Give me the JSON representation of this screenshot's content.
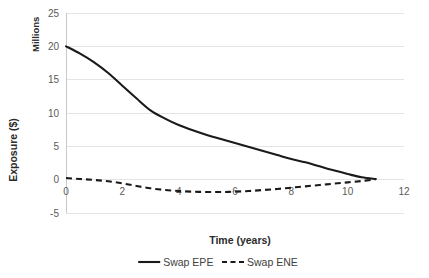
{
  "chart_data": {
    "type": "line",
    "title": "",
    "xlabel": "Time (years)",
    "ylabel": "Exposure ($)",
    "unit_label": "Millions",
    "xlim": [
      0,
      12
    ],
    "ylim": [
      -5,
      25
    ],
    "xticks": [
      "0",
      "2",
      "4",
      "6",
      "8",
      "10",
      "12"
    ],
    "yticks": [
      "25",
      "20",
      "15",
      "10",
      "5",
      "0",
      "-5"
    ],
    "grid": "horizontal",
    "legend_position": "bottom",
    "x": [
      0,
      0.5,
      1,
      1.5,
      2,
      2.5,
      3,
      3.5,
      4,
      4.5,
      5,
      5.5,
      6,
      6.5,
      7,
      7.5,
      8,
      8.5,
      9,
      9.5,
      10,
      10.5,
      11
    ],
    "series": [
      {
        "name": "Swap EPE",
        "style": "solid",
        "color": "#1a1a1a",
        "values": [
          20.0,
          18.9,
          17.6,
          16.0,
          14.1,
          12.2,
          10.4,
          9.2,
          8.2,
          7.4,
          6.7,
          6.1,
          5.5,
          4.9,
          4.3,
          3.7,
          3.1,
          2.6,
          2.0,
          1.4,
          0.85,
          0.35,
          0.1
        ]
      },
      {
        "name": "Swap ENE",
        "style": "dashed",
        "color": "#1a1a1a",
        "values": [
          0.25,
          0.1,
          -0.05,
          -0.25,
          -0.55,
          -0.95,
          -1.3,
          -1.55,
          -1.7,
          -1.8,
          -1.85,
          -1.85,
          -1.8,
          -1.7,
          -1.55,
          -1.4,
          -1.2,
          -1.0,
          -0.8,
          -0.6,
          -0.4,
          -0.2,
          0.05
        ]
      }
    ],
    "legend": [
      {
        "label": "Swap EPE",
        "style": "solid"
      },
      {
        "label": "Swap ENE",
        "style": "dashed"
      }
    ]
  }
}
